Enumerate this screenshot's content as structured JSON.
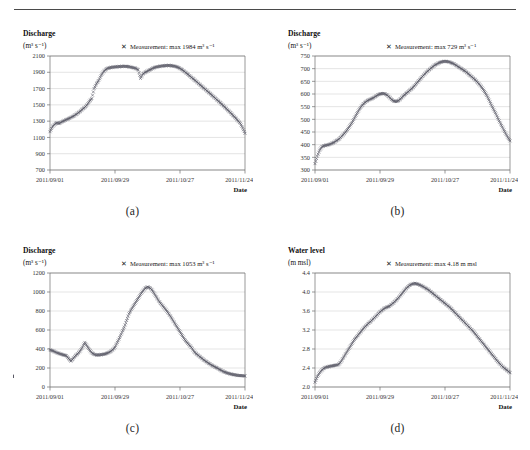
{
  "figure": {
    "panel_captions": [
      "(a)",
      "(b)",
      "(c)",
      "(d)"
    ],
    "marker_glyph": "✕",
    "marker_color": "#5a5a66",
    "gridline_color": "#c8c8c8",
    "axis_color": "#6e6e6e",
    "x_axis_label": "Date"
  },
  "chart_data": [
    {
      "id": "a",
      "type": "scatter",
      "title": "Discharge",
      "ylabel": "Discharge",
      "yunit": "(m³ s⁻¹)",
      "xlabel": "Date",
      "legend": "Measurement: max 1984 m³ s⁻¹",
      "legend_marker": "✕",
      "max_value": 1984,
      "ylim": [
        700,
        2100
      ],
      "ytick_step": 200,
      "yticks": [
        700,
        900,
        1100,
        1300,
        1500,
        1700,
        1900,
        2100
      ],
      "xticks": [
        "2011/09/01",
        "2011/09/29",
        "2011/10/27",
        "2011/11/24"
      ],
      "xtick_days": [
        0,
        28,
        56,
        84
      ],
      "x_range_days": [
        0,
        84
      ],
      "grid": true,
      "legend_position": "top-right",
      "x": [
        0,
        1,
        2,
        3,
        4,
        5,
        6,
        7,
        8,
        9,
        10,
        11,
        12,
        13,
        14,
        15,
        16,
        17,
        18,
        19,
        20,
        21,
        22,
        23,
        24,
        25,
        26,
        27,
        28,
        29,
        30,
        31,
        32,
        33,
        34,
        35,
        36,
        37,
        38,
        39,
        40,
        41,
        42,
        43,
        44,
        45,
        46,
        47,
        48,
        49,
        50,
        51,
        52,
        53,
        54,
        55,
        56,
        57,
        58,
        59,
        60,
        61,
        62,
        63,
        64,
        65,
        66,
        67,
        68,
        69,
        70,
        71,
        72,
        73,
        74,
        75,
        76,
        77,
        78,
        79,
        80,
        81,
        82,
        83,
        84
      ],
      "values": [
        1170,
        1230,
        1262,
        1280,
        1272,
        1290,
        1305,
        1318,
        1330,
        1345,
        1360,
        1378,
        1398,
        1420,
        1448,
        1470,
        1500,
        1545,
        1578,
        1700,
        1760,
        1800,
        1860,
        1905,
        1935,
        1950,
        1958,
        1962,
        1966,
        1968,
        1970,
        1972,
        1974,
        1972,
        1968,
        1962,
        1955,
        1948,
        1930,
        1825,
        1878,
        1900,
        1915,
        1930,
        1945,
        1958,
        1966,
        1972,
        1976,
        1980,
        1982,
        1984,
        1982,
        1978,
        1972,
        1962,
        1948,
        1930,
        1908,
        1884,
        1860,
        1836,
        1812,
        1788,
        1762,
        1738,
        1712,
        1688,
        1662,
        1638,
        1612,
        1586,
        1560,
        1534,
        1508,
        1480,
        1452,
        1424,
        1396,
        1366,
        1336,
        1304,
        1272,
        1216,
        1150
      ]
    },
    {
      "id": "b",
      "type": "scatter",
      "title": "Discharge",
      "ylabel": "Discharge",
      "yunit": "(m³ s⁻¹)",
      "xlabel": "Date",
      "legend": "Measurement: max 729  m³ s⁻¹",
      "legend_marker": "✕",
      "max_value": 729,
      "ylim": [
        300,
        750
      ],
      "ytick_step": 50,
      "yticks": [
        300,
        350,
        400,
        450,
        500,
        550,
        600,
        650,
        700,
        750
      ],
      "xticks": [
        "2011/09/01",
        "2011/09/29",
        "2011/10/27",
        "2011/11/24"
      ],
      "xtick_days": [
        0,
        28,
        56,
        84
      ],
      "x_range_days": [
        0,
        84
      ],
      "grid": true,
      "legend_position": "top-right",
      "x": [
        0,
        1,
        2,
        3,
        4,
        5,
        6,
        7,
        8,
        9,
        10,
        11,
        12,
        13,
        14,
        15,
        16,
        17,
        18,
        19,
        20,
        21,
        22,
        23,
        24,
        25,
        26,
        27,
        28,
        29,
        30,
        31,
        32,
        33,
        34,
        35,
        36,
        37,
        38,
        39,
        40,
        41,
        42,
        43,
        44,
        45,
        46,
        47,
        48,
        49,
        50,
        51,
        52,
        53,
        54,
        55,
        56,
        57,
        58,
        59,
        60,
        61,
        62,
        63,
        64,
        65,
        66,
        67,
        68,
        69,
        70,
        71,
        72,
        73,
        74,
        75,
        76,
        77,
        78,
        79,
        80,
        81,
        82,
        83,
        84
      ],
      "values": [
        325,
        355,
        378,
        392,
        396,
        398,
        400,
        404,
        408,
        414,
        420,
        428,
        438,
        448,
        460,
        474,
        488,
        505,
        522,
        538,
        552,
        562,
        570,
        576,
        580,
        584,
        590,
        596,
        600,
        602,
        601,
        596,
        588,
        578,
        572,
        570,
        574,
        582,
        592,
        600,
        608,
        616,
        624,
        634,
        645,
        656,
        666,
        676,
        686,
        694,
        702,
        710,
        716,
        721,
        725,
        728,
        729,
        728,
        726,
        722,
        718,
        712,
        706,
        700,
        694,
        688,
        680,
        672,
        664,
        656,
        646,
        636,
        624,
        610,
        594,
        576,
        556,
        538,
        520,
        500,
        482,
        464,
        446,
        430,
        415
      ]
    },
    {
      "id": "c",
      "type": "scatter",
      "title": "Discharge",
      "ylabel": "Discharge",
      "yunit": "(m³ s⁻¹)",
      "xlabel": "Date",
      "legend": "Measurement: max 1053 m³ s⁻¹",
      "legend_marker": "✕",
      "max_value": 1053,
      "ylim": [
        0,
        1200
      ],
      "ytick_step": 200,
      "yticks": [
        0,
        200,
        400,
        600,
        800,
        1000,
        1200
      ],
      "xticks": [
        "2011/09/01",
        "2011/09/29",
        "2011/10/27",
        "2011/11/24"
      ],
      "xtick_days": [
        0,
        28,
        56,
        84
      ],
      "x_range_days": [
        0,
        84
      ],
      "grid": true,
      "legend_position": "top-right",
      "x": [
        0,
        1,
        2,
        3,
        4,
        5,
        6,
        7,
        8,
        9,
        10,
        11,
        12,
        13,
        14,
        15,
        16,
        17,
        18,
        19,
        20,
        21,
        22,
        23,
        24,
        25,
        26,
        27,
        28,
        29,
        30,
        31,
        32,
        33,
        34,
        35,
        36,
        37,
        38,
        39,
        40,
        41,
        42,
        43,
        44,
        45,
        46,
        47,
        48,
        49,
        50,
        51,
        52,
        53,
        54,
        55,
        56,
        57,
        58,
        59,
        60,
        61,
        62,
        63,
        64,
        65,
        66,
        67,
        68,
        69,
        70,
        71,
        72,
        73,
        74,
        75,
        76,
        77,
        78,
        79,
        80,
        81,
        82,
        83,
        84
      ],
      "values": [
        392,
        382,
        372,
        360,
        352,
        344,
        336,
        330,
        300,
        272,
        300,
        330,
        352,
        380,
        420,
        470,
        430,
        392,
        360,
        344,
        336,
        338,
        340,
        344,
        350,
        360,
        372,
        392,
        420,
        470,
        520,
        575,
        630,
        700,
        770,
        815,
        855,
        895,
        935,
        975,
        1010,
        1040,
        1053,
        1045,
        1020,
        980,
        940,
        900,
        870,
        840,
        810,
        775,
        740,
        700,
        660,
        620,
        580,
        540,
        500,
        468,
        440,
        415,
        375,
        350,
        330,
        310,
        290,
        272,
        255,
        240,
        225,
        212,
        200,
        185,
        172,
        160,
        150,
        142,
        136,
        130,
        126,
        122,
        120,
        118,
        116,
        112,
        110
      ]
    },
    {
      "id": "d",
      "type": "scatter",
      "title": "Water level",
      "ylabel": "Water level",
      "yunit": "(m msl)",
      "xlabel": "Date",
      "legend": "Measurement: max 4.18 m msl",
      "legend_marker": "✕",
      "max_value": 4.18,
      "ylim": [
        2.0,
        4.4
      ],
      "ytick_step": 0.4,
      "yticks": [
        2.0,
        2.4,
        2.8,
        3.2,
        3.6,
        4.0,
        4.4
      ],
      "ytick_labels": [
        "2.0",
        "2.4",
        "2.8",
        "3.2",
        "3.6",
        "4.0",
        "4.4"
      ],
      "xticks": [
        "2011/09/01",
        "2011/09/29",
        "2011/10/27",
        "2011/11/24"
      ],
      "xtick_days": [
        0,
        28,
        56,
        84
      ],
      "x_range_days": [
        0,
        84
      ],
      "grid": true,
      "legend_position": "top-right",
      "x": [
        0,
        1,
        2,
        3,
        4,
        5,
        6,
        7,
        8,
        9,
        10,
        11,
        12,
        13,
        14,
        15,
        16,
        17,
        18,
        19,
        20,
        21,
        22,
        23,
        24,
        25,
        26,
        27,
        28,
        29,
        30,
        31,
        32,
        33,
        34,
        35,
        36,
        37,
        38,
        39,
        40,
        41,
        42,
        43,
        44,
        45,
        46,
        47,
        48,
        49,
        50,
        51,
        52,
        53,
        54,
        55,
        56,
        57,
        58,
        59,
        60,
        61,
        62,
        63,
        64,
        65,
        66,
        67,
        68,
        69,
        70,
        71,
        72,
        73,
        74,
        75,
        76,
        77,
        78,
        79,
        80,
        81,
        82,
        83,
        84
      ],
      "values": [
        2.1,
        2.22,
        2.3,
        2.36,
        2.4,
        2.42,
        2.43,
        2.44,
        2.45,
        2.46,
        2.47,
        2.52,
        2.6,
        2.68,
        2.76,
        2.84,
        2.92,
        3.0,
        3.06,
        3.12,
        3.18,
        3.24,
        3.29,
        3.34,
        3.38,
        3.43,
        3.48,
        3.53,
        3.58,
        3.62,
        3.66,
        3.68,
        3.7,
        3.74,
        3.78,
        3.83,
        3.88,
        3.94,
        4.0,
        4.06,
        4.11,
        4.15,
        4.17,
        4.18,
        4.17,
        4.15,
        4.13,
        4.1,
        4.07,
        4.04,
        4.0,
        3.96,
        3.92,
        3.88,
        3.84,
        3.8,
        3.76,
        3.72,
        3.68,
        3.63,
        3.58,
        3.53,
        3.48,
        3.43,
        3.38,
        3.33,
        3.28,
        3.23,
        3.18,
        3.12,
        3.06,
        3.0,
        2.94,
        2.88,
        2.82,
        2.76,
        2.7,
        2.64,
        2.58,
        2.52,
        2.47,
        2.42,
        2.38,
        2.34,
        2.3
      ]
    }
  ]
}
